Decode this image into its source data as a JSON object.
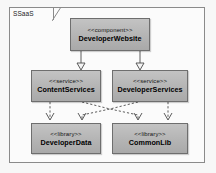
{
  "diagram": {
    "kind": "uml-component-diagram",
    "package": {
      "label": "SSaaS"
    },
    "colors": {
      "node_fill": "#b4b4b4",
      "node_border": "#6e6e6e",
      "frame_border": "#8a8a8a",
      "edge": "#4a4a4a",
      "canvas": "#f7f7f7",
      "frame_fill": "#fbfbfb",
      "text": "#000000"
    },
    "nodes": [
      {
        "id": "website",
        "stereotype": "<<component>>",
        "name": "DeveloperWebsite"
      },
      {
        "id": "content",
        "stereotype": "<<service>>",
        "name": "ContentServices"
      },
      {
        "id": "devsvc",
        "stereotype": "<<service>>",
        "name": "DeveloperServices"
      },
      {
        "id": "devdata",
        "stereotype": "<<library>>",
        "name": "DeveloperData"
      },
      {
        "id": "common",
        "stereotype": "<<library>>",
        "name": "CommonLib"
      }
    ],
    "edges": [
      {
        "from": "website",
        "to": "content",
        "style": "solid",
        "arrow": "hollow-triangle",
        "relation": "realization"
      },
      {
        "from": "website",
        "to": "devsvc",
        "style": "solid",
        "arrow": "hollow-triangle",
        "relation": "realization"
      },
      {
        "from": "content",
        "to": "devdata",
        "style": "dashed",
        "arrow": "open-v",
        "relation": "dependency"
      },
      {
        "from": "content",
        "to": "common",
        "style": "dashed",
        "arrow": "open-v",
        "relation": "dependency"
      },
      {
        "from": "devsvc",
        "to": "common",
        "style": "dashed",
        "arrow": "open-v",
        "relation": "dependency"
      },
      {
        "from": "devsvc",
        "to": "devdata",
        "style": "dashed",
        "arrow": "open-v",
        "relation": "dependency"
      }
    ]
  }
}
